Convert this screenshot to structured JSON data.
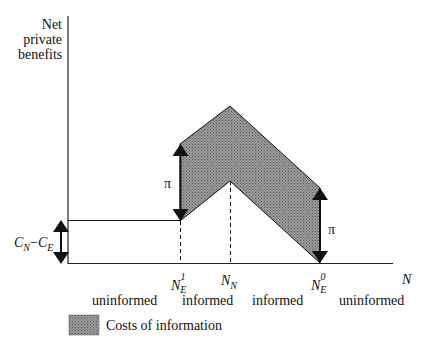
{
  "yaxis": {
    "label_lines": [
      "Net",
      "private",
      "benefits"
    ]
  },
  "xaxis": {
    "label": "N"
  },
  "ticks": [
    {
      "base": "N",
      "sub": "E",
      "sup": "1"
    },
    {
      "base": "N",
      "sub": "N",
      "sup": ""
    },
    {
      "base": "N",
      "sub": "E",
      "sup": "0"
    }
  ],
  "left_bracket": {
    "label_a": "C",
    "sub_a": "N",
    "op": "−",
    "label_b": "C",
    "sub_b": "E"
  },
  "pi_label": "π",
  "regions": [
    "uninformed",
    "informed",
    "informed",
    "uninformed"
  ],
  "legend": {
    "label": "Costs of information",
    "color": "#8a8a8a"
  },
  "colors": {
    "fill": "#8a8a8a",
    "line": "#111111"
  }
}
